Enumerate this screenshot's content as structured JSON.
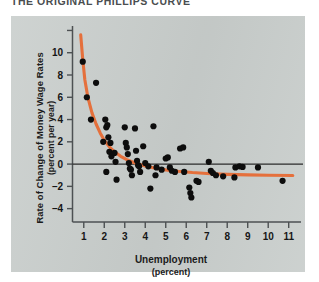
{
  "figure": {
    "title": "THE ORIGINAL PHILLIPS CURVE",
    "panel_color": "#c9cecc",
    "curve_color": "#e5703c",
    "dot_color": "#0d0d0d",
    "axis_color": "#4d5153"
  },
  "axes": {
    "y_title_line1": "Rate of Change of Money Wage Rates",
    "y_title_line2": "(percent per year)",
    "x_title_line1": "Unemployment",
    "x_title_line2": "(percent)",
    "y_ticks": [
      "10",
      "8",
      "6",
      "4",
      "2",
      "0",
      "–2",
      "–4"
    ],
    "x_ticks": [
      "1",
      "2",
      "3",
      "4",
      "5",
      "6",
      "7",
      "8",
      "9",
      "10",
      "11"
    ]
  },
  "chart_data": {
    "type": "scatter",
    "title": "THE ORIGINAL PHILLIPS CURVE",
    "xlabel": "Unemployment (percent)",
    "ylabel": "Rate of Change of Money Wage Rates (percent per year)",
    "xlim": [
      0.45,
      11.6
    ],
    "ylim": [
      -5.2,
      12.4
    ],
    "grid": false,
    "legend": null,
    "annotations": [
      {
        "text": "zero wage-change reference line",
        "y": 0
      }
    ],
    "series": [
      {
        "name": "Observations",
        "type": "scatter",
        "marker": "filled-circle",
        "color": "#0d0d0d",
        "points": [
          [
            0.95,
            9.2
          ],
          [
            1.15,
            6.0
          ],
          [
            1.6,
            7.3
          ],
          [
            1.35,
            4.0
          ],
          [
            1.95,
            2.0
          ],
          [
            2.05,
            4.0
          ],
          [
            2.1,
            3.3
          ],
          [
            2.15,
            3.5
          ],
          [
            2.2,
            2.4
          ],
          [
            2.3,
            1.9
          ],
          [
            2.25,
            1.1
          ],
          [
            2.35,
            0.7
          ],
          [
            2.1,
            -0.7
          ],
          [
            2.5,
            1.0
          ],
          [
            2.55,
            0.2
          ],
          [
            2.6,
            -1.4
          ],
          [
            3.0,
            3.3
          ],
          [
            3.05,
            1.9
          ],
          [
            3.1,
            1.5
          ],
          [
            3.15,
            0.9
          ],
          [
            3.2,
            0.1
          ],
          [
            3.25,
            -0.4
          ],
          [
            3.3,
            -0.5
          ],
          [
            3.35,
            -1.0
          ],
          [
            3.5,
            3.2
          ],
          [
            3.55,
            1.2
          ],
          [
            3.6,
            0.3
          ],
          [
            3.65,
            -0.1
          ],
          [
            3.7,
            -0.2
          ],
          [
            3.75,
            -0.7
          ],
          [
            3.9,
            1.6
          ],
          [
            4.0,
            0.1
          ],
          [
            4.15,
            -0.2
          ],
          [
            4.25,
            -2.2
          ],
          [
            4.4,
            3.4
          ],
          [
            4.5,
            -1.0
          ],
          [
            4.55,
            -0.3
          ],
          [
            4.8,
            -0.5
          ],
          [
            5.0,
            0.5
          ],
          [
            5.1,
            0.6
          ],
          [
            5.2,
            -0.3
          ],
          [
            5.3,
            -0.6
          ],
          [
            5.45,
            -0.7
          ],
          [
            5.7,
            1.4
          ],
          [
            5.85,
            1.5
          ],
          [
            5.9,
            -0.7
          ],
          [
            6.15,
            -2.1
          ],
          [
            6.2,
            -2.6
          ],
          [
            6.25,
            -3.0
          ],
          [
            6.5,
            -1.5
          ],
          [
            6.6,
            -1.6
          ],
          [
            7.1,
            0.2
          ],
          [
            7.2,
            -0.6
          ],
          [
            7.3,
            -0.8
          ],
          [
            7.45,
            -1.0
          ],
          [
            7.8,
            -1.1
          ],
          [
            8.35,
            -1.2
          ],
          [
            8.4,
            -0.3
          ],
          [
            8.6,
            -0.2
          ],
          [
            8.75,
            -0.25
          ],
          [
            9.5,
            -0.3
          ],
          [
            10.7,
            -1.5
          ]
        ]
      },
      {
        "name": "Fitted Phillips curve",
        "type": "line",
        "color": "#e5703c",
        "line_width": 3,
        "points": [
          [
            0.85,
            11.6
          ],
          [
            0.95,
            9.4
          ],
          [
            1.05,
            7.6
          ],
          [
            1.2,
            6.0
          ],
          [
            1.4,
            4.6
          ],
          [
            1.6,
            3.6
          ],
          [
            1.8,
            2.8
          ],
          [
            2.0,
            2.15
          ],
          [
            2.25,
            1.55
          ],
          [
            2.5,
            1.1
          ],
          [
            2.8,
            0.7
          ],
          [
            3.1,
            0.4
          ],
          [
            3.5,
            0.1
          ],
          [
            4.0,
            -0.18
          ],
          [
            4.5,
            -0.38
          ],
          [
            5.0,
            -0.52
          ],
          [
            5.6,
            -0.65
          ],
          [
            6.3,
            -0.76
          ],
          [
            7.0,
            -0.84
          ],
          [
            8.0,
            -0.92
          ],
          [
            9.0,
            -0.97
          ],
          [
            10.0,
            -1.0
          ],
          [
            11.2,
            -1.03
          ]
        ]
      }
    ]
  }
}
